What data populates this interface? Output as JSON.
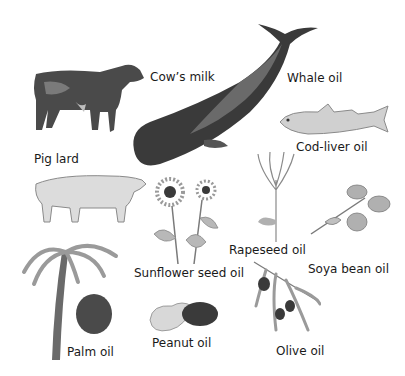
{
  "labels": {
    "cow": "Cow’s milk",
    "whale": "Whale oil",
    "cod": "Cod-liver oil",
    "pig": "Pig lard",
    "sunflower": "Sunflower seed oil",
    "rapeseed": "Rapeseed oil",
    "soya": "Soya bean oil",
    "palm": "Palm oil",
    "peanut": "Peanut oil",
    "olive": "Olive oil"
  },
  "colors": {
    "background": "#ffffff",
    "ink": "#1a1a1a",
    "dark_animal": "#3a3a3a",
    "mid_gray": "#8a8a8a",
    "light_gray": "#c8c8c8"
  }
}
